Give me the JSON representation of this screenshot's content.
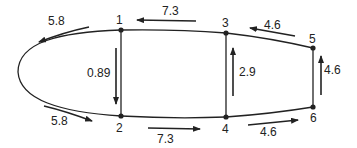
{
  "diagram": {
    "type": "flow-network",
    "nodes": [
      {
        "id": "1",
        "label": "1",
        "x": 121,
        "y": 30
      },
      {
        "id": "2",
        "label": "2",
        "x": 121,
        "y": 116
      },
      {
        "id": "3",
        "label": "3",
        "x": 226,
        "y": 33
      },
      {
        "id": "4",
        "label": "4",
        "x": 226,
        "y": 117
      },
      {
        "id": "5",
        "label": "5",
        "x": 313,
        "y": 48
      },
      {
        "id": "6",
        "label": "6",
        "x": 313,
        "y": 107
      }
    ],
    "flows": [
      {
        "from": "3",
        "to": "1",
        "value": "7.3"
      },
      {
        "from": "1",
        "to": "nose-top",
        "value": "5.8"
      },
      {
        "from": "5",
        "to": "3",
        "value": "4.6"
      },
      {
        "from": "1",
        "to": "2",
        "value": "0.89"
      },
      {
        "from": "4",
        "to": "3",
        "value": "2.9"
      },
      {
        "from": "6",
        "to": "5",
        "value": "4.6"
      },
      {
        "from": "nose-bottom",
        "to": "2",
        "value": "5.8"
      },
      {
        "from": "2",
        "to": "4",
        "value": "7.3"
      },
      {
        "from": "4",
        "to": "6",
        "value": "4.6"
      }
    ],
    "labels": {
      "flow_top_left": "5.8",
      "flow_top_12_3": "7.3",
      "flow_top_35": "4.6",
      "flow_left_vertical": "0.89",
      "flow_mid_vertical": "2.9",
      "flow_right_vertical": "4.6",
      "flow_bottom_left": "5.8",
      "flow_bottom_24": "7.3",
      "flow_bottom_46": "4.6"
    },
    "colors": {
      "line": "#222222",
      "background": "#ffffff"
    }
  }
}
